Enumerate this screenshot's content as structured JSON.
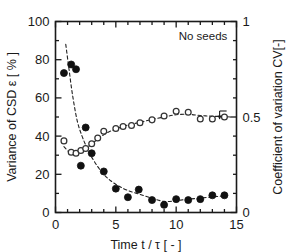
{
  "chart_data": {
    "type": "scatter",
    "title": "",
    "annotation": "No seeds",
    "xlabel": "Time   t / τ  [ - ]",
    "ylabel_left": "Variance of CSD   ε  [ % ]",
    "ylabel_right": "Coefficient of variation CV[-]",
    "xlim": [
      0,
      15
    ],
    "ylim_left": [
      0,
      100
    ],
    "ylim_right": [
      0,
      1
    ],
    "xticks": [
      0,
      5,
      10,
      15
    ],
    "xticklabels": [
      "0",
      "5",
      "10",
      "15"
    ],
    "yticks_left": [
      0,
      20,
      40,
      60,
      80,
      100
    ],
    "yticklabels_left": [
      "0",
      "20",
      "40",
      "60",
      "80",
      "100"
    ],
    "yticks_right": [
      0,
      0.5,
      1
    ],
    "yticklabels_right": [
      "0",
      "0.5",
      "1"
    ],
    "grid": false,
    "legend": "none",
    "series": [
      {
        "name": "Variance of CSD",
        "marker": "filled-circle",
        "color": "#111111",
        "axis": "left",
        "x": [
          0.7,
          1.3,
          1.7,
          2.1,
          2.5,
          3.0,
          4.0,
          5.0,
          6.0,
          6.9,
          8.0,
          9.0,
          10.0,
          11.0,
          12.0,
          13.0,
          14.0
        ],
        "y": [
          73,
          77.5,
          75,
          24.5,
          44.5,
          31,
          21.5,
          12.5,
          8,
          12,
          6.5,
          4,
          7,
          6.5,
          7,
          9,
          9
        ]
      },
      {
        "name": "Coefficient of variation CV",
        "marker": "open-circle",
        "color": "#333333",
        "axis": "right",
        "x": [
          0.7,
          1.3,
          1.7,
          2.1,
          2.5,
          3.0,
          3.5,
          4.0,
          5.0,
          5.6,
          6.3,
          7.0,
          8.0,
          9.0,
          10.0,
          11.0,
          12.0,
          13.0,
          14.0
        ],
        "y": [
          0.375,
          0.315,
          0.31,
          0.325,
          0.335,
          0.36,
          0.39,
          0.425,
          0.44,
          0.45,
          0.455,
          0.47,
          0.485,
          0.505,
          0.53,
          0.525,
          0.49,
          0.49,
          0.5
        ]
      }
    ],
    "fit_curves": [
      {
        "name": "variance-fit",
        "style": "dashed",
        "axis": "left",
        "x": [
          0.85,
          1.1,
          1.4,
          1.8,
          2.2,
          2.6,
          3.0,
          3.5,
          4.0,
          4.6,
          5.2,
          6.0,
          7.0,
          8.0,
          9.0,
          10.0,
          11.0,
          12.0,
          13.0,
          14.0
        ],
        "y": [
          88,
          76,
          62,
          48,
          40,
          34,
          29,
          24,
          20,
          16.5,
          14,
          11.5,
          9.5,
          7.5,
          5.8,
          6.2,
          7.0,
          7.5,
          8.2,
          8.6
        ]
      },
      {
        "name": "cv-fit",
        "style": "dashed",
        "axis": "right",
        "x": [
          0.7,
          1.2,
          1.8,
          2.4,
          3.0,
          3.6,
          4.3,
          5.0,
          6.0,
          7.0,
          8.0,
          9.0,
          10.0,
          11.0,
          12.0,
          13.0,
          14.0,
          14.6
        ],
        "y": [
          0.345,
          0.315,
          0.315,
          0.333,
          0.358,
          0.39,
          0.418,
          0.437,
          0.458,
          0.472,
          0.487,
          0.5,
          0.512,
          0.514,
          0.508,
          0.504,
          0.502,
          0.5
        ]
      }
    ],
    "arrows": [
      {
        "name": "cv-axis-arrow",
        "x": 13.6,
        "y": 0.5,
        "axis": "right",
        "direction": "down-right"
      }
    ]
  }
}
